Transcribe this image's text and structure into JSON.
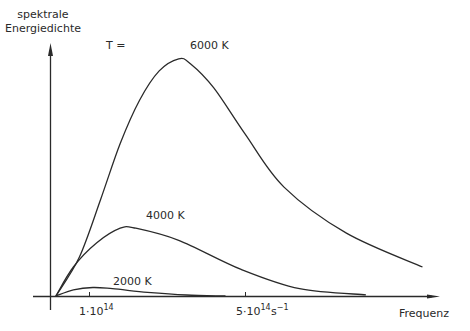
{
  "chart_data": {
    "type": "line",
    "title": "",
    "ylabel": "spektrale Energiedichte",
    "xlabel": "Frequenz",
    "x_unit": "s⁻¹",
    "x_ticks": [
      {
        "value": 100000000000000.0,
        "label_mantissa": "1·10",
        "label_exp": "14"
      },
      {
        "value": 500000000000000.0,
        "label_mantissa": "5·10",
        "label_exp": "14"
      }
    ],
    "legend_prefix": "T =",
    "grid": false,
    "axis_color": "#2a2a2a",
    "line_color": "#2a2a2a",
    "xlim": [
      0,
      980000000000000.0
    ],
    "series": [
      {
        "name": "6000 K",
        "x": [
          15000000000000.0,
          75000000000000.0,
          130000000000000.0,
          180000000000000.0,
          230000000000000.0,
          280000000000000.0,
          330000000000000.0,
          360000000000000.0,
          420000000000000.0,
          500000000000000.0,
          600000000000000.0,
          760000000000000.0,
          955000000000000.0
        ],
        "y": [
          0,
          0.16,
          0.4,
          0.63,
          0.81,
          0.93,
          0.98,
          0.96,
          0.86,
          0.67,
          0.45,
          0.26,
          0.12
        ]
      },
      {
        "name": "4000 K",
        "x": [
          15000000000000.0,
          60000000000000.0,
          120000000000000.0,
          180000000000000.0,
          220000000000000.0,
          330000000000000.0,
          490000000000000.0,
          640000000000000.0,
          810000000000000.0
        ],
        "y": [
          0,
          0.12,
          0.22,
          0.28,
          0.28,
          0.23,
          0.11,
          0.03,
          0.005
        ]
      },
      {
        "name": "2000 K",
        "x": [
          15000000000000.0,
          60000000000000.0,
          110000000000000.0,
          160000000000000.0,
          250000000000000.0,
          350000000000000.0,
          450000000000000.0
        ],
        "y": [
          0,
          0.025,
          0.035,
          0.03,
          0.015,
          0.004,
          0.0
        ]
      }
    ],
    "annotations": [
      {
        "text": "T =",
        "x_px": 105,
        "y_px": 51
      },
      {
        "text": "6000 K",
        "x_px": 190,
        "y_px": 51
      },
      {
        "text": "4000 K",
        "x_px": 146,
        "y_px": 220
      },
      {
        "text": "2000 K",
        "x_px": 113,
        "y_px": 287
      }
    ]
  },
  "labels": {
    "ylabel_line1": "spektrale",
    "ylabel_line2": "Energiedichte",
    "t_equals": "T =",
    "curve_6000": "6000 K",
    "curve_4000": "4000 K",
    "curve_2000": "2000 K",
    "xlabel": "Frequenz",
    "tick1_mantissa": "1·10",
    "tick1_exp": "14",
    "tick5_mantissa": "5·10",
    "tick5_exp": "14",
    "unit_base": "s",
    "unit_exp": "−1"
  }
}
